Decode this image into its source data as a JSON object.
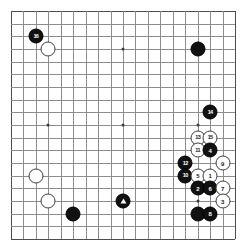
{
  "board": {
    "name": "go-board",
    "size": 19,
    "background_color": "#ffffff",
    "line_color": "#8c8c8c",
    "edge_color": "#4d4d4d",
    "star_points": [
      {
        "col": 3,
        "row": 3
      },
      {
        "col": 9,
        "row": 3
      },
      {
        "col": 15,
        "row": 3
      },
      {
        "col": 3,
        "row": 9
      },
      {
        "col": 9,
        "row": 9
      },
      {
        "col": 15,
        "row": 9
      },
      {
        "col": 3,
        "row": 15
      },
      {
        "col": 9,
        "row": 15
      },
      {
        "col": 15,
        "row": 15
      }
    ],
    "stone_colors": {
      "black": "#111111",
      "white": "#ffffff",
      "black_label": "#ffffff",
      "white_label": "#1a1a1a"
    }
  },
  "stones": [
    {
      "name": "stone-black-16",
      "color": "black",
      "col": 2,
      "row": 2,
      "label": "16",
      "marker": ""
    },
    {
      "name": "stone-white-plain-d16",
      "color": "white",
      "col": 3,
      "row": 3,
      "label": "",
      "marker": ""
    },
    {
      "name": "stone-black-plain-q16",
      "color": "black",
      "col": 15,
      "row": 3,
      "label": "",
      "marker": ""
    },
    {
      "name": "stone-black-14",
      "color": "black",
      "col": 16,
      "row": 8,
      "label": "14",
      "marker": ""
    },
    {
      "name": "stone-white-13",
      "color": "white",
      "col": 15,
      "row": 10,
      "label": "13",
      "marker": ""
    },
    {
      "name": "stone-white-15",
      "color": "white",
      "col": 16,
      "row": 10,
      "label": "15",
      "marker": ""
    },
    {
      "name": "stone-white-11",
      "color": "white",
      "col": 15,
      "row": 11,
      "label": "11",
      "marker": ""
    },
    {
      "name": "stone-black-4",
      "color": "black",
      "col": 16,
      "row": 11,
      "label": "4",
      "marker": ""
    },
    {
      "name": "stone-black-12",
      "color": "black",
      "col": 14,
      "row": 12,
      "label": "12",
      "marker": ""
    },
    {
      "name": "stone-white-9",
      "color": "white",
      "col": 17,
      "row": 12,
      "label": "9",
      "marker": ""
    },
    {
      "name": "stone-black-10",
      "color": "black",
      "col": 14,
      "row": 13,
      "label": "10",
      "marker": ""
    },
    {
      "name": "stone-white-5",
      "color": "white",
      "col": 15,
      "row": 13,
      "label": "5",
      "marker": ""
    },
    {
      "name": "stone-white-1",
      "color": "white",
      "col": 16,
      "row": 13,
      "label": "1",
      "marker": ""
    },
    {
      "name": "stone-white-plain-d10",
      "color": "white",
      "col": 2,
      "row": 13,
      "label": "",
      "marker": ""
    },
    {
      "name": "stone-black-2",
      "color": "black",
      "col": 15,
      "row": 14,
      "label": "2",
      "marker": ""
    },
    {
      "name": "stone-black-6",
      "color": "black",
      "col": 16,
      "row": 14,
      "label": "6",
      "marker": ""
    },
    {
      "name": "stone-white-7",
      "color": "white",
      "col": 17,
      "row": 14,
      "label": "7",
      "marker": ""
    },
    {
      "name": "stone-white-plain-c6",
      "color": "white",
      "col": 3,
      "row": 15,
      "label": "",
      "marker": ""
    },
    {
      "name": "stone-black-triangle",
      "color": "black",
      "col": 9,
      "row": 15,
      "label": "",
      "marker": "triangle"
    },
    {
      "name": "stone-white-3",
      "color": "white",
      "col": 17,
      "row": 15,
      "label": "3",
      "marker": ""
    },
    {
      "name": "stone-black-plain-d4",
      "color": "black",
      "col": 5,
      "row": 16,
      "label": "",
      "marker": ""
    },
    {
      "name": "stone-black-plain-q3",
      "color": "black",
      "col": 15,
      "row": 16,
      "label": "",
      "marker": ""
    },
    {
      "name": "stone-black-8",
      "color": "black",
      "col": 16,
      "row": 16,
      "label": "8",
      "marker": ""
    }
  ]
}
